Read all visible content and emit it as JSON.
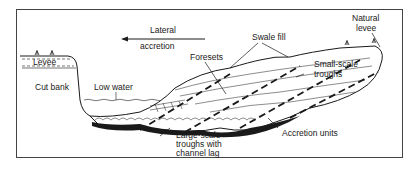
{
  "diagram": {
    "type": "cross-section",
    "labels": {
      "lateral_accretion_line1": "Lateral",
      "lateral_accretion_line2": "accretion",
      "swale_fill": "Swale fill",
      "natural_levee_line1": "Natural",
      "natural_levee_line2": "levee",
      "levee": "Levee",
      "foresets": "Foresets",
      "small_scale_troughs_line1": "Small-scale",
      "small_scale_troughs_line2": "troughs",
      "cut_bank": "Cut bank",
      "low_water": "Low water",
      "large_scale_troughs_line1": "Large-scale",
      "large_scale_troughs_line2": "troughs with",
      "large_scale_troughs_line3": "channel lag",
      "accretion_units": "Accretion units"
    },
    "arrow_direction": "left",
    "colors": {
      "ink": "#1a1a1a",
      "frame": "#444444",
      "background": "#ffffff"
    }
  }
}
